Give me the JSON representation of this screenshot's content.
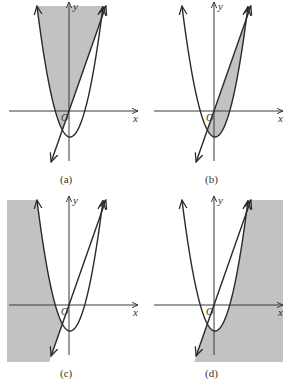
{
  "figure": {
    "axis_labels": {
      "x": "x",
      "y": "y",
      "origin": "O"
    },
    "colors": {
      "shade": "#c2c2c2",
      "curve": "#2a2a2a",
      "axis": "#3a3a3a"
    },
    "panels": [
      {
        "id": "a",
        "caption": "(a)",
        "shaded_region": "inside parabola, above line"
      },
      {
        "id": "b",
        "caption": "(b)",
        "shaded_region": "inside parabola, below line"
      },
      {
        "id": "c",
        "caption": "(c)",
        "shaded_region": "outside parabola, above line"
      },
      {
        "id": "d",
        "caption": "(d)",
        "shaded_region": "outside parabola, below line"
      }
    ]
  }
}
